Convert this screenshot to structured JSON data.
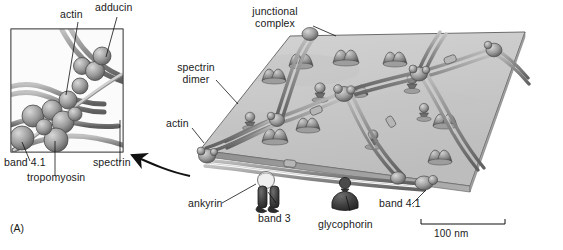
{
  "figure": {
    "panel_letter": "(A)",
    "scale_bar": {
      "label": "100 nm"
    },
    "colors": {
      "background": "#ffffff",
      "membrane_face": "#c9c9c9",
      "membrane_edge": "#6e6e6e",
      "membrane_rim": "#9a9a9a",
      "protein_dark": "#3a3a3a",
      "protein_mid": "#7d7d7d",
      "spectrin_light": "#b8b8b8",
      "spectrin_dark": "#6a6a6a",
      "line": "#1a1a1a",
      "text": "#1a1a1a"
    }
  },
  "inset": {
    "name": "junctional-complex-closeup",
    "labels": [
      {
        "id": "actin",
        "text": "actin"
      },
      {
        "id": "adducin",
        "text": "adducin"
      },
      {
        "id": "band41",
        "text": "band 4.1"
      },
      {
        "id": "tropomyosin",
        "text": "tropomyosin"
      },
      {
        "id": "spectrin",
        "text": "spectrin"
      }
    ]
  },
  "main": {
    "name": "erythrocyte-membrane-skeleton",
    "labels": [
      {
        "id": "junctional-complex",
        "line1": "junctional",
        "line2": "complex"
      },
      {
        "id": "spectrin-dimer",
        "line1": "spectrin",
        "line2": "dimer"
      },
      {
        "id": "actin",
        "text": "actin"
      },
      {
        "id": "ankyrin",
        "text": "ankyrin"
      },
      {
        "id": "band3",
        "text": "band 3"
      },
      {
        "id": "glycophorin",
        "text": "glycophorin"
      },
      {
        "id": "band41",
        "text": "band 4.1"
      }
    ]
  }
}
